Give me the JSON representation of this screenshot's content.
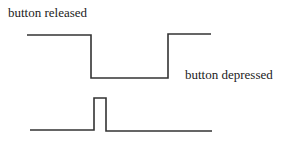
{
  "diagram": {
    "labels": {
      "released": "button released",
      "depressed": "button depressed"
    },
    "line_color": "#333333",
    "waveforms": [
      {
        "name": "button-signal",
        "description": "raw button level: high when released, low when depressed",
        "points": "27,35 91,35 91,78 168,78 168,34 211,34"
      },
      {
        "name": "pulse-signal",
        "description": "short pulse generated at the press edge",
        "points": "30,130 94,130 94,98 106,98 106,131 212,131"
      }
    ]
  }
}
